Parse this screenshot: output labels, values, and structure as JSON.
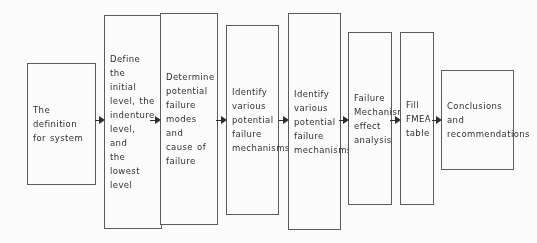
{
  "diagram": {
    "type": "flowchart",
    "orientation": "left-to-right",
    "title": "",
    "background_color": "#ffffff",
    "box_border_color": "#5a5a5a",
    "text_color": "#2e2e2e",
    "arrow_color": "#2b2b2b",
    "nodes": [
      {
        "id": "n1",
        "label": "The\ndefinition\nfor system",
        "x": 27,
        "y": 63,
        "w": 69,
        "h": 122,
        "align": "left"
      },
      {
        "id": "n2",
        "label": "Define the\ninitial\nlevel, the\nindenture\nlevel, and\nthe lowest\nlevel",
        "x": 104,
        "y": 15,
        "w": 58,
        "h": 214,
        "align": "left"
      },
      {
        "id": "n3",
        "label": "Determine\npotential\nfailure\nmodes and\ncause of\nfailure",
        "x": 160,
        "y": 13,
        "w": 58,
        "h": 212,
        "align": "left"
      },
      {
        "id": "n4",
        "label": "Identify\nvarious\npotential\nfailure\nmechanisms",
        "x": 226,
        "y": 25,
        "w": 53,
        "h": 190,
        "align": "left"
      },
      {
        "id": "n5",
        "label": "Identify\nvarious\npotential\nfailure\nmechanisms",
        "x": 288,
        "y": 13,
        "w": 53,
        "h": 217,
        "align": "left"
      },
      {
        "id": "n6",
        "label": "Failure\nMechanism\neffect\nanalysis",
        "x": 348,
        "y": 32,
        "w": 44,
        "h": 173,
        "align": "left"
      },
      {
        "id": "n7",
        "label": "Fill\nFMEA\ntable",
        "x": 400,
        "y": 32,
        "w": 34,
        "h": 173,
        "align": "left"
      },
      {
        "id": "n8",
        "label": "Conclusions and\nrecommendations",
        "x": 441,
        "y": 70,
        "w": 73,
        "h": 100,
        "align": "left"
      }
    ],
    "arrows": [
      {
        "id": "a1",
        "from": "n1",
        "to": "n2",
        "x": 95,
        "y": 120,
        "w": 10
      },
      {
        "id": "a2",
        "from": "n2",
        "to": "n3",
        "x": 150,
        "y": 120,
        "w": 11
      },
      {
        "id": "a3",
        "from": "n3",
        "to": "n4",
        "x": 216,
        "y": 120,
        "w": 11
      },
      {
        "id": "a4",
        "from": "n4",
        "to": "n5",
        "x": 278,
        "y": 120,
        "w": 11
      },
      {
        "id": "a5",
        "from": "n5",
        "to": "n6",
        "x": 339,
        "y": 120,
        "w": 10
      },
      {
        "id": "a6",
        "from": "n6",
        "to": "n7",
        "x": 390,
        "y": 120,
        "w": 11
      },
      {
        "id": "a7",
        "from": "n7",
        "to": "n8",
        "x": 432,
        "y": 120,
        "w": 10
      }
    ]
  }
}
